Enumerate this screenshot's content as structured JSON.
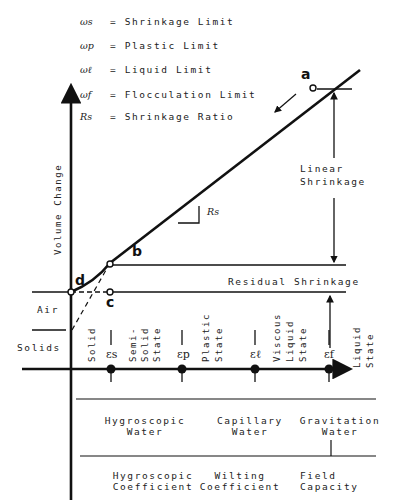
{
  "legend": [
    {
      "symbol": "ωs",
      "text": "= Shrinkage Limit"
    },
    {
      "symbol": "ωp",
      "text": "= Plastic Limit"
    },
    {
      "symbol": "ωℓ",
      "text": "= Liquid Limit"
    },
    {
      "symbol": "ωf",
      "text": "= Flocculation Limit"
    },
    {
      "symbol": "Rs",
      "text": "= Shrinkage Ratio"
    }
  ],
  "axis": {
    "y_label": "Volume Change"
  },
  "points": {
    "a": "a",
    "b": "b",
    "c": "c",
    "d": "d"
  },
  "annotations": {
    "slope_label": "Rs",
    "linear_shrinkage_1": "Linear",
    "linear_shrinkage_2": "Shrinkage",
    "residual_shrinkage": "Residual Shrinkage",
    "air": "Air",
    "solids": "Solids"
  },
  "states": [
    {
      "lines": [
        "Solid"
      ]
    },
    {
      "lines": [
        "Semi-",
        "Solid",
        "State"
      ]
    },
    {
      "lines": [
        "Plastic",
        "State"
      ]
    },
    {
      "lines": [
        "Viscous",
        "Liquid",
        "State"
      ]
    },
    {
      "lines": [
        "Liquid",
        "State"
      ]
    }
  ],
  "limits": [
    {
      "symbol": "εs"
    },
    {
      "symbol": "εp"
    },
    {
      "symbol": "εℓ"
    },
    {
      "symbol": "εf"
    }
  ],
  "water_types": [
    {
      "line1": "Hygroscopic",
      "line2": "Water"
    },
    {
      "line1": "Capillary",
      "line2": "Water"
    },
    {
      "line1": "Gravitation",
      "line2": "Water"
    }
  ],
  "coefficients": [
    {
      "line1": "Hygroscopic",
      "line2": "Coefficient"
    },
    {
      "line1": "Wilting",
      "line2": "Coefficient"
    },
    {
      "line1": "Field",
      "line2": "Capacity"
    }
  ]
}
